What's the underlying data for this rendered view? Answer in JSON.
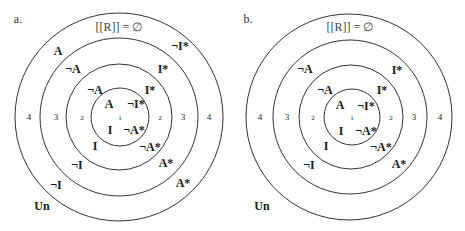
{
  "panels": [
    {
      "id": "a",
      "panel_label": "a.",
      "title": "[[R]] = ∅",
      "outside_label": "Un",
      "ring_numbers": {
        "r1": "1",
        "r2": "2",
        "r3": "3",
        "r4": "4"
      },
      "labels": {
        "inner_A": "A",
        "inner_notIstar": "¬I*",
        "inner_I": "I",
        "inner_notAstar": "¬A*",
        "r2_notA": "¬A",
        "r2_Istar": "I*",
        "r2_I": "I",
        "r2_notAstar": "¬A*",
        "r3_notA": "¬A",
        "r3_Istar": "I*",
        "r3_notI": "¬I",
        "r3_Astar": "A*",
        "r4_A": "A",
        "r4_notIstar": "¬I*",
        "r4_notI": "¬I",
        "r4_Astar": "A*"
      }
    },
    {
      "id": "b",
      "panel_label": "b.",
      "title": "[[R]] = ∅",
      "outside_label": "Un",
      "ring_numbers": {
        "r1": "1",
        "r2": "2",
        "r3": "3",
        "r4": "4"
      },
      "labels": {
        "inner_A": "A",
        "inner_notIstar": "¬I*",
        "inner_I": "I",
        "inner_notAstar": "¬A*",
        "r2_notA": "¬A",
        "r2_Istar": "I*",
        "r2_I": "I",
        "r2_notAstar": "¬A*",
        "r3_notA": "¬A",
        "r3_Istar": "I*",
        "r3_notI": "¬I",
        "r3_Astar": "A*"
      }
    }
  ]
}
